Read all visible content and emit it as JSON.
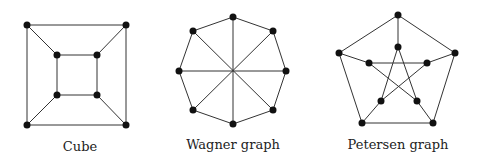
{
  "graphs": [
    {
      "name": "cube",
      "label": "Cube",
      "label_pos": [
        80,
        151
      ],
      "nodes": [
        [
          27,
          25
        ],
        [
          126,
          25
        ],
        [
          27,
          125
        ],
        [
          126,
          125
        ],
        [
          57,
          55
        ],
        [
          97,
          55
        ],
        [
          57,
          95
        ],
        [
          97,
          95
        ]
      ],
      "edges": [
        [
          0,
          1
        ],
        [
          1,
          3
        ],
        [
          3,
          2
        ],
        [
          2,
          0
        ],
        [
          4,
          5
        ],
        [
          5,
          7
        ],
        [
          7,
          6
        ],
        [
          6,
          4
        ],
        [
          0,
          4
        ],
        [
          1,
          5
        ],
        [
          2,
          6
        ],
        [
          3,
          7
        ]
      ]
    },
    {
      "name": "wagner-graph",
      "label": "Wagner graph",
      "label_pos": [
        233,
        149
      ],
      "nodes": [
        [
          233,
          17
        ],
        [
          273,
          31
        ],
        [
          286,
          71
        ],
        [
          273,
          110
        ],
        [
          233,
          124
        ],
        [
          193,
          110
        ],
        [
          179,
          71
        ],
        [
          193,
          31
        ]
      ],
      "edges": [
        [
          0,
          1
        ],
        [
          1,
          2
        ],
        [
          2,
          3
        ],
        [
          3,
          4
        ],
        [
          4,
          5
        ],
        [
          5,
          6
        ],
        [
          6,
          7
        ],
        [
          7,
          0
        ],
        [
          0,
          4
        ],
        [
          1,
          5
        ],
        [
          2,
          6
        ],
        [
          3,
          7
        ]
      ]
    },
    {
      "name": "petersen-graph",
      "label": "Petersen graph",
      "label_pos": [
        398,
        149
      ],
      "nodes": [
        [
          398,
          15
        ],
        [
          455,
          53
        ],
        [
          433,
          123
        ],
        [
          362,
          123
        ],
        [
          339,
          53
        ],
        [
          398,
          47
        ],
        [
          427,
          63
        ],
        [
          417,
          101
        ],
        [
          381,
          101
        ],
        [
          369,
          63
        ]
      ],
      "edges": [
        [
          0,
          1
        ],
        [
          1,
          2
        ],
        [
          2,
          3
        ],
        [
          3,
          4
        ],
        [
          4,
          0
        ],
        [
          0,
          5
        ],
        [
          1,
          6
        ],
        [
          2,
          7
        ],
        [
          3,
          8
        ],
        [
          4,
          9
        ],
        [
          5,
          7
        ],
        [
          7,
          9
        ],
        [
          9,
          6
        ],
        [
          6,
          8
        ],
        [
          8,
          5
        ]
      ]
    }
  ],
  "style": {
    "node_color": "#111111",
    "edge_color": "#333333",
    "node_radius": 3.5
  }
}
